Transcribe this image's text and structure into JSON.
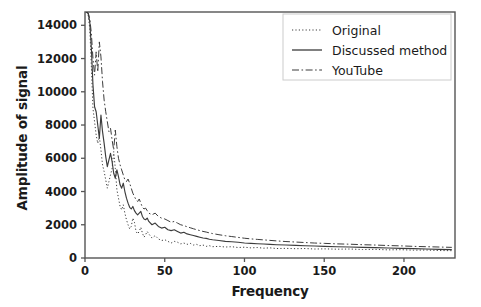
{
  "chart_data": {
    "type": "line",
    "title": "",
    "xlabel": "Frequency",
    "ylabel": "Amplitude of signal",
    "xlim": [
      0,
      232
    ],
    "ylim": [
      0,
      14800
    ],
    "xticks": [
      0,
      50,
      100,
      150,
      200
    ],
    "yticks": [
      0,
      2000,
      4000,
      6000,
      8000,
      10000,
      12000,
      14000
    ],
    "xtick_labels": [
      "0",
      "50",
      "100",
      "150",
      "200"
    ],
    "ytick_labels": [
      "0",
      "2000",
      "4000",
      "6000",
      "8000",
      "10000",
      "12000",
      "14000"
    ],
    "grid": false,
    "legend_position": "upper right",
    "line_color": "#3c3c3c",
    "frame_color": "#555555",
    "background": "#ffffff",
    "series": [
      {
        "name": "Original",
        "linestyle": "dotted",
        "x": [
          1,
          2,
          3,
          4,
          5,
          6,
          7,
          8,
          9,
          10,
          11,
          12,
          13,
          14,
          15,
          16,
          17,
          18,
          19,
          20,
          21,
          22,
          23,
          24,
          25,
          26,
          27,
          28,
          29,
          30,
          31,
          32,
          33,
          34,
          35,
          36,
          37,
          38,
          39,
          40,
          42,
          44,
          46,
          48,
          50,
          52,
          54,
          56,
          58,
          60,
          62,
          64,
          66,
          68,
          70,
          72,
          74,
          76,
          78,
          80,
          84,
          88,
          92,
          96,
          100,
          104,
          108,
          112,
          116,
          120,
          126,
          132,
          138,
          144,
          150,
          158,
          166,
          174,
          182,
          190,
          198,
          206,
          214,
          222,
          230
        ],
        "y": [
          14800,
          14600,
          13800,
          11500,
          9000,
          8200,
          7400,
          6900,
          7300,
          6500,
          5600,
          5200,
          4700,
          4200,
          4600,
          5000,
          5400,
          6400,
          5400,
          4100,
          3600,
          3100,
          2900,
          3200,
          2700,
          2300,
          2000,
          1750,
          1900,
          2400,
          2150,
          1600,
          1450,
          1600,
          1850,
          1500,
          1250,
          1400,
          1600,
          1450,
          1200,
          1350,
          1150,
          1050,
          1100,
          1000,
          900,
          1000,
          950,
          850,
          900,
          820,
          880,
          780,
          820,
          740,
          780,
          700,
          740,
          680,
          700,
          660,
          680,
          630,
          650,
          610,
          630,
          590,
          610,
          570,
          580,
          560,
          570,
          540,
          550,
          530,
          540,
          510,
          520,
          490,
          500,
          470,
          480,
          450,
          440
        ]
      },
      {
        "name": "Discussed method",
        "linestyle": "solid",
        "x": [
          1,
          2,
          3,
          4,
          5,
          6,
          7,
          8,
          9,
          10,
          11,
          12,
          13,
          14,
          15,
          16,
          17,
          18,
          19,
          20,
          21,
          22,
          23,
          24,
          25,
          26,
          27,
          28,
          29,
          30,
          31,
          32,
          33,
          34,
          35,
          36,
          37,
          38,
          39,
          40,
          42,
          44,
          46,
          48,
          50,
          52,
          54,
          56,
          58,
          60,
          62,
          64,
          66,
          68,
          70,
          72,
          74,
          76,
          78,
          80,
          84,
          88,
          92,
          96,
          100,
          104,
          108,
          112,
          116,
          120,
          126,
          132,
          138,
          144,
          150,
          158,
          166,
          174,
          182,
          190,
          198,
          206,
          214,
          222,
          230
        ],
        "y": [
          14800,
          14700,
          14200,
          12600,
          10400,
          9100,
          8800,
          8000,
          7200,
          8600,
          7600,
          6900,
          6100,
          5500,
          5900,
          6300,
          5800,
          5100,
          4800,
          5300,
          4900,
          4400,
          4200,
          4500,
          4000,
          3600,
          3300,
          3050,
          2950,
          3100,
          2850,
          2700,
          2600,
          2700,
          2800,
          2500,
          2350,
          2300,
          2400,
          2200,
          2000,
          2100,
          1900,
          1800,
          1850,
          1700,
          1650,
          1700,
          1600,
          1500,
          1550,
          1450,
          1400,
          1350,
          1300,
          1250,
          1200,
          1180,
          1130,
          1100,
          1050,
          1000,
          980,
          950,
          900,
          880,
          860,
          840,
          820,
          800,
          780,
          760,
          740,
          720,
          700,
          680,
          660,
          640,
          620,
          600,
          580,
          560,
          540,
          520,
          500
        ]
      },
      {
        "name": "YouTube",
        "linestyle": "dashdot",
        "x": [
          1,
          2,
          3,
          4,
          5,
          6,
          7,
          8,
          9,
          10,
          11,
          12,
          13,
          14,
          15,
          16,
          17,
          18,
          19,
          20,
          21,
          22,
          23,
          24,
          25,
          26,
          27,
          28,
          29,
          30,
          31,
          32,
          33,
          34,
          35,
          36,
          37,
          38,
          39,
          40,
          42,
          44,
          46,
          48,
          50,
          52,
          54,
          56,
          58,
          60,
          62,
          64,
          66,
          68,
          70,
          72,
          74,
          76,
          78,
          80,
          84,
          88,
          92,
          96,
          100,
          104,
          108,
          112,
          116,
          120,
          126,
          132,
          138,
          144,
          150,
          158,
          166,
          174,
          182,
          190,
          198,
          206,
          214,
          222,
          230
        ],
        "y": [
          14800,
          14750,
          14400,
          13500,
          12000,
          11000,
          12400,
          11200,
          13000,
          12100,
          10600,
          9500,
          8800,
          8200,
          7600,
          7800,
          7100,
          6500,
          7700,
          6700,
          6000,
          5600,
          5300,
          5000,
          4700,
          4600,
          4750,
          4500,
          4200,
          3900,
          3700,
          3500,
          3400,
          3550,
          3300,
          3050,
          2950,
          3000,
          2850,
          2700,
          2600,
          2700,
          2500,
          2400,
          2350,
          2250,
          2150,
          2200,
          2100,
          2000,
          1950,
          1880,
          1820,
          1760,
          1700,
          1650,
          1600,
          1560,
          1510,
          1470,
          1400,
          1340,
          1290,
          1240,
          1190,
          1150,
          1120,
          1090,
          1060,
          1030,
          990,
          960,
          930,
          900,
          880,
          850,
          830,
          800,
          780,
          750,
          730,
          700,
          680,
          660,
          640
        ]
      }
    ]
  },
  "legend": {
    "items": [
      {
        "label": "Original",
        "style": "dotted"
      },
      {
        "label": "Discussed method",
        "style": "solid"
      },
      {
        "label": "YouTube",
        "style": "dashdot"
      }
    ]
  }
}
